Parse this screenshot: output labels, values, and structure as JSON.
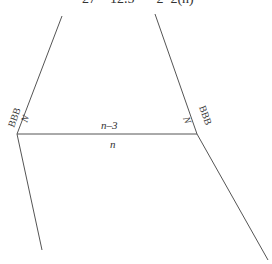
{
  "header": {
    "cropped_text": "27    12.5  =  2  2(n)"
  },
  "labels": {
    "left_vertex_label": "BBB",
    "right_vertex_label": "BBB",
    "left_angle": "N",
    "right_angle": "N",
    "top_segment": "n–3",
    "bottom_segment": "n"
  },
  "colors": {
    "line": "#555555",
    "text": "#333333",
    "background": "#ffffff"
  }
}
